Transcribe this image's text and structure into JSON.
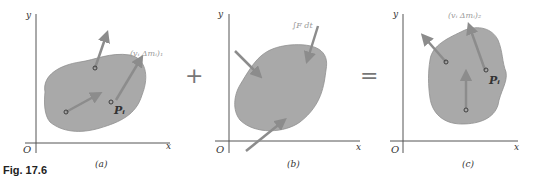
{
  "figure": {
    "caption": "Fig. 17.6",
    "colors": {
      "body_fill": "#a9a9a9",
      "body_edge": "#8f8f8f",
      "arrow": "#8c8c8c",
      "axis": "#555555",
      "text": "#333333"
    },
    "operators": {
      "plus": "+",
      "equals": "="
    },
    "panels": [
      {
        "id": "a",
        "label": "(a)",
        "axes": {
          "x": "x",
          "y": "y",
          "origin": "O"
        },
        "vector_label": "(vᵢ Δmᵢ)₁",
        "point_label": "Pᵢ"
      },
      {
        "id": "b",
        "label": "(b)",
        "axes": {
          "x": "x",
          "y": "y",
          "origin": "O"
        },
        "vector_label": "∫F dt"
      },
      {
        "id": "c",
        "label": "(c)",
        "axes": {
          "x": "x",
          "y": "y",
          "origin": "O"
        },
        "vector_label": "(vᵢ Δmᵢ)₂",
        "point_label": "Pᵢ"
      }
    ]
  }
}
